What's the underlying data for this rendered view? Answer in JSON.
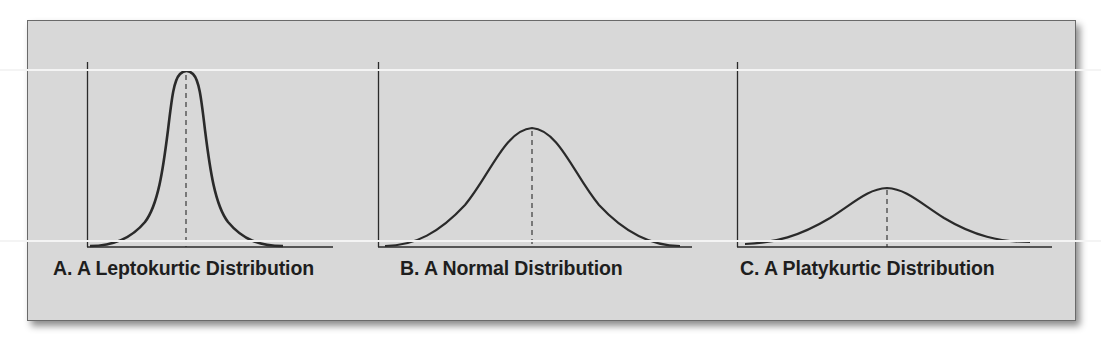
{
  "figure": {
    "panels": [
      {
        "id": "A",
        "label": "A. A Leptokurtic Distribution",
        "kurtosis": "leptokurtic",
        "peak_height": 0.94
      },
      {
        "id": "B",
        "label": "B. A Normal Distribution",
        "kurtosis": "mesokurtic",
        "peak_height": 0.64
      },
      {
        "id": "C",
        "label": "C. A Platykurtic Distribution",
        "kurtosis": "platykurtic",
        "peak_height": 0.32
      }
    ]
  },
  "colors": {
    "background": "#d8d8d8",
    "curve": "#2a2a2a",
    "text": "#1e1e1e",
    "border": "#6a6a6a"
  }
}
